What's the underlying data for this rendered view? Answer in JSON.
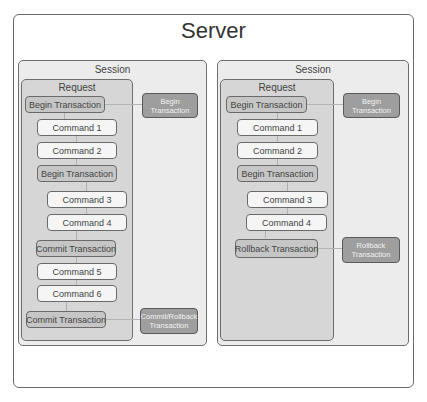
{
  "server": {
    "title": "Server"
  },
  "sessions": [
    {
      "title": "Session",
      "request": {
        "title": "Request",
        "steps": [
          {
            "label": "Begin Transaction",
            "kind": "transaction"
          },
          {
            "label": "Command 1",
            "kind": "command"
          },
          {
            "label": "Command 2",
            "kind": "command"
          },
          {
            "label": "Begin Transaction",
            "kind": "transaction"
          },
          {
            "label": "Command 3",
            "kind": "command"
          },
          {
            "label": "Command 4",
            "kind": "command"
          },
          {
            "label": "Commit Transaction",
            "kind": "transaction"
          },
          {
            "label": "Command 5",
            "kind": "command"
          },
          {
            "label": "Command 6",
            "kind": "command"
          },
          {
            "label": "Commit Transaction",
            "kind": "transaction"
          }
        ]
      },
      "external": [
        {
          "line1": "Begin",
          "line2": "Transaction",
          "linked_step": "Begin Transaction"
        },
        {
          "line1": "Commit/Rollback",
          "line2": "Transaction",
          "linked_step": "Commit Transaction"
        }
      ]
    },
    {
      "title": "Session",
      "request": {
        "title": "Request",
        "steps": [
          {
            "label": "Begin Transaction",
            "kind": "transaction"
          },
          {
            "label": "Command 1",
            "kind": "command"
          },
          {
            "label": "Command 2",
            "kind": "command"
          },
          {
            "label": "Begin Transaction",
            "kind": "transaction"
          },
          {
            "label": "Command 3",
            "kind": "command"
          },
          {
            "label": "Command 4",
            "kind": "command"
          },
          {
            "label": "Rollback Transaction",
            "kind": "transaction"
          }
        ]
      },
      "external": [
        {
          "line1": "Begin",
          "line2": "Transaction",
          "linked_step": "Begin Transaction"
        },
        {
          "line1": "Rollback",
          "line2": "Transaction",
          "linked_step": "Rollback Transaction"
        }
      ]
    }
  ],
  "colors": {
    "session_bg": "#ececec",
    "request_bg": "#d6d6d6",
    "command_bg": "#f5f5f5",
    "transaction_bg": "#c6c6c6",
    "external_bg": "#9e9e9e",
    "border": "#6a6a6a"
  }
}
